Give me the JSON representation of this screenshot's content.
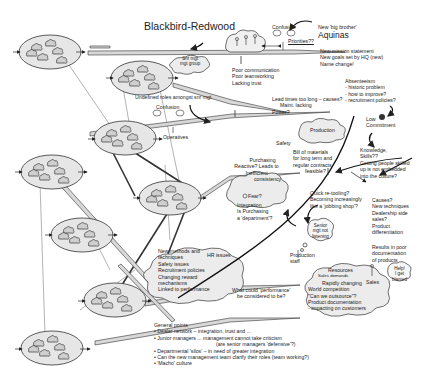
{
  "title": "Blackbird-Redwood",
  "colors": {
    "ellipse_fill": "#e6e6e6",
    "cloud_fill": "#ececec",
    "stroke": "#333333",
    "background": "#ffffff"
  },
  "nodes": {
    "top_right_org": {
      "lines": [
        "New 'big brother'",
        "Aquinas"
      ]
    },
    "mission": {
      "lines": [
        "New mission statement",
        "New goals set by HQ (new)",
        "Name change!"
      ]
    },
    "confusion_top": {
      "label": "Confusion",
      "priorities": "Priorities??"
    },
    "snr_mgt_group": {
      "lines": [
        "Snr mgt",
        "mgt group"
      ]
    },
    "undefined_roles": {
      "label": "Undefined roles amongst snr mgt"
    },
    "communication": {
      "lines": [
        "Poor communication",
        "Poor teamworking",
        "Lacking trust"
      ]
    },
    "absenteeism": {
      "lines": [
        "Absenteeism",
        " - historic problem",
        " - how to improve?",
        " - recruitment policies?"
      ]
    },
    "lead_times": {
      "lines": [
        "Lead times too long – causes?",
        "Maint. lacking",
        "Power?"
      ]
    },
    "confusion_mid": {
      "label": "Confusion"
    },
    "operatives": {
      "label": "Operatives"
    },
    "commitment": {
      "lines": [
        "Low",
        "Commitment"
      ]
    },
    "production": {
      "label": "Production"
    },
    "safety": {
      "label": "Safety"
    },
    "bill_of_materials": {
      "lines": [
        "Bill of materials",
        "for long term and",
        "regular contracts",
        "feasible?"
      ]
    },
    "purchasing": {
      "lines": [
        "Purchasing",
        "Reactive? Leads to",
        "Inefficient",
        "consistency"
      ]
    },
    "knowledge": {
      "lines": [
        "Knowledge,",
        "Skills??",
        "Getting people skilled",
        "up is not embedded",
        "into the culture?"
      ]
    },
    "fear": {
      "label": "Fear?"
    },
    "integration": {
      "lines": [
        "Integration",
        "Is Purchasing",
        "a 'department'?"
      ]
    },
    "retooling": {
      "lines": [
        "Quick re-tooling?",
        "Becoming increasingly",
        "like a 'jobbing shop'?"
      ]
    },
    "causes": {
      "lines": [
        "Causes?",
        "New techniques",
        "Dealership side",
        "sales?",
        "Product",
        "differentiation"
      ]
    },
    "senior_mgt": {
      "lines": [
        "Senior",
        "mgt not",
        "listening"
      ]
    },
    "production_staff": {
      "lines": [
        "Production",
        "staff"
      ]
    },
    "results_poor": {
      "lines": [
        "Results in poor",
        "documentation",
        "of products"
      ]
    },
    "hr_issues": {
      "title": "HR issues",
      "lines": [
        "New methods and",
        "techniques",
        "Safety issues",
        "Recruitment policies",
        "Changing reward",
        "mechanisms",
        "Linked to performance"
      ]
    },
    "performance_question": {
      "lines": [
        "What could 'performance'",
        "be considered to be?"
      ]
    },
    "sales_cloud": {
      "lines": [
        "Resources",
        "Sales demands",
        "Rapidly changing",
        "World competition",
        "\"Can we outsource\"?",
        "Product documentation",
        " - impacting on customers"
      ],
      "sales_label": "Sales"
    },
    "help": {
      "lines": [
        "Help!",
        "I get",
        "blamed"
      ]
    },
    "general_points": {
      "heading": "General points",
      "bullets": [
        "• Dealer network – integration, trust and ...",
        "• Junior managers ... management cannot take criticism",
        "(are senior managers 'defensive'?)",
        "• Departmental 'silos' – in need of greater integration",
        "• Can the new management team clarify their roles (team working?)",
        "• 'Macho' culture"
      ]
    }
  }
}
